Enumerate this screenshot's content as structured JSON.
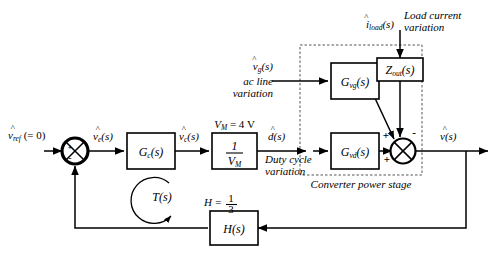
{
  "diagram": {
    "background_color": "#ffffff",
    "line_color": "#000000",
    "dashed_box_color": "#555555"
  },
  "inputs": {
    "reference": {
      "symbol": "v",
      "sub": "ref",
      "hat": "^",
      "note": "(= 0)"
    },
    "ac_line": {
      "symbol": "v",
      "sub": "g",
      "suffix": "(s)",
      "caption_line1": "ac line",
      "caption_line2": "variation"
    },
    "load_current": {
      "symbol": "i",
      "sub": "load",
      "suffix": "(s)",
      "caption_line1": "Load current",
      "caption_line2": "variation"
    }
  },
  "signals": {
    "error": {
      "symbol": "v",
      "sub": "e",
      "suffix": "(s)"
    },
    "control": {
      "symbol": "v",
      "sub": "c",
      "suffix": "(s)"
    },
    "duty": {
      "symbol": "d",
      "suffix": "(s)",
      "caption_line1": "Duty cycle",
      "caption_line2": "variation"
    },
    "output": {
      "symbol": "v",
      "suffix": "(s)"
    }
  },
  "blocks": {
    "compensator": {
      "label": "G",
      "sub": "c",
      "suffix": "(s)"
    },
    "pwm": {
      "numerator": "1",
      "denominator_symbol": "V",
      "denominator_sub": "M",
      "above_label": "V",
      "above_sub": "M",
      "above_value": "= 4 V"
    },
    "gvg": {
      "label": "G",
      "sub": "vg",
      "suffix": "(s)"
    },
    "gvd": {
      "label": "G",
      "sub": "vd",
      "suffix": "(s)"
    },
    "zout": {
      "label": "Z",
      "sub": "out",
      "suffix": "(s)"
    },
    "sensor": {
      "label": "H",
      "suffix": "(s)",
      "above_label": "H =",
      "above_num": "1",
      "above_den": "3"
    }
  },
  "annotations": {
    "loop_gain": {
      "label": "T",
      "suffix": "(s)"
    },
    "power_stage_caption": "Converter power stage"
  },
  "summing_junctions": {
    "input_summer": {
      "signs": [
        "+",
        "-"
      ],
      "style": "filled-crossed"
    },
    "output_summer": {
      "sign_gvg": "+",
      "sign_zout": "-",
      "sign_gvd": "+",
      "style": "crossed"
    }
  }
}
